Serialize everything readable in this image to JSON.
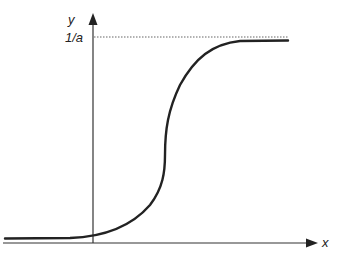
{
  "diagram": {
    "type": "sigmoid-curve",
    "y_axis_label": "y",
    "x_axis_label": "x",
    "asymptote_label": "1/a",
    "colors": {
      "axis": "#333333",
      "curve": "#222222",
      "asymptote": "#666666",
      "background": "#ffffff"
    }
  }
}
